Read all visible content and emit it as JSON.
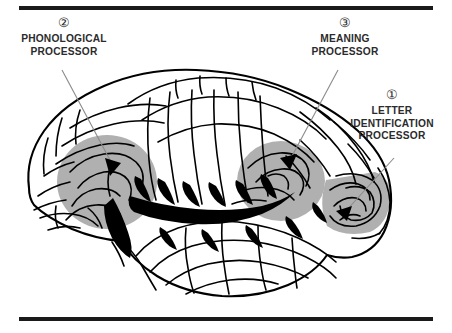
{
  "figure": {
    "background_color": "#ffffff",
    "rule_color": "#1a1a1a",
    "shaded_region_color": "#b0b0b0",
    "outline_color": "#000000",
    "leader_line_color": "#8a8a8a"
  },
  "callouts": [
    {
      "number": "②",
      "number_plain": "2",
      "line1": "PHONOLOGICAL",
      "line2": "PROCESSOR",
      "line3": "",
      "region": "left-inferior-frontal"
    },
    {
      "number": "③",
      "number_plain": "3",
      "line1": "MEANING",
      "line2": "PROCESSOR",
      "line3": "",
      "region": "posterior-superior-temporal"
    },
    {
      "number": "①",
      "number_plain": "1",
      "line1": "LETTER",
      "line2": "IDENTIFICATION",
      "line3": "PROCESSOR",
      "region": "occipito-temporal"
    }
  ]
}
